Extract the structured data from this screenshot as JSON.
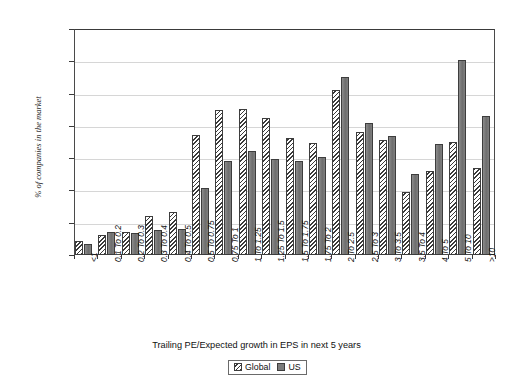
{
  "chart_data": {
    "type": "bar",
    "title": "",
    "xlabel": "Trailing PE/Expected growth in EPS in next 5 years",
    "ylabel": "% of companies in the market",
    "ylim": [
      0,
      14
    ],
    "ytick_labels": [
      "14.00%",
      "12.00%",
      "10.00%",
      "8.00%",
      "6.00%",
      "4.00%",
      "2.00%",
      "0.00%"
    ],
    "ytick_values": [
      14,
      12,
      10,
      8,
      6,
      4,
      2,
      0
    ],
    "y_unit": "%",
    "grid": true,
    "legend_position": "bottom-center",
    "categories": [
      "<1",
      "0.1 To 0.2",
      "0.2 To 0.3",
      "0.3 To 0.4",
      "0.4 To 0.5",
      "0.5 To 0.75",
      "0.75 To 1",
      "1 To 1.25",
      "1.25 To 1.5",
      "1.5 To 1.75",
      "1.75 To 2",
      "2 To 2.5",
      "2.5 To 3",
      "3 To 3.5",
      "3.5 To 4",
      "4 To 5",
      "5 To 10",
      ">10"
    ],
    "series": [
      {
        "name": "Global",
        "color": "#f2f2f2",
        "pattern": "diagonal-hatch",
        "values": [
          0.85,
          1.25,
          1.45,
          2.4,
          2.65,
          7.45,
          9.0,
          9.05,
          8.5,
          7.25,
          6.95,
          10.2,
          7.6,
          7.1,
          3.9,
          5.2,
          7.0,
          5.4
        ]
      },
      {
        "name": "US",
        "color": "#7b7b7b",
        "pattern": "solid",
        "values": [
          0.7,
          1.4,
          1.35,
          1.55,
          1.6,
          4.15,
          5.8,
          6.45,
          5.95,
          5.85,
          6.05,
          11.0,
          8.2,
          7.35,
          5.0,
          6.85,
          12.1,
          8.6
        ]
      }
    ]
  },
  "legend": {
    "items": [
      {
        "label": "Global"
      },
      {
        "label": "US"
      }
    ]
  },
  "top_strip": {
    "text": ""
  }
}
